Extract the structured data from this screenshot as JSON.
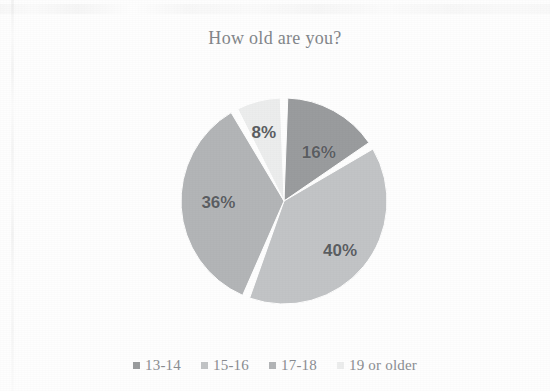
{
  "chart_data": {
    "type": "pie",
    "title": "How old are you?",
    "categories": [
      "13-14",
      "15-16",
      "17-18",
      "19 or older"
    ],
    "values": [
      16,
      40,
      36,
      8
    ],
    "value_labels": [
      "16%",
      "40%",
      "36%",
      "8%"
    ],
    "unit": "%",
    "legend_position": "bottom",
    "grid": false,
    "start_angle_deg": 0,
    "direction": "clockwise",
    "colors": [
      "#9a9c9e",
      "#c2c4c6",
      "#b3b5b7",
      "#eceded"
    ],
    "slices": [
      {
        "label": "13-14",
        "value": 16,
        "value_label": "16%",
        "color": "#9a9c9e"
      },
      {
        "label": "15-16",
        "value": 40,
        "value_label": "40%",
        "color": "#c2c4c6"
      },
      {
        "label": "17-18",
        "value": 36,
        "value_label": "36%",
        "color": "#b3b5b7"
      },
      {
        "label": "19 or older",
        "value": 8,
        "value_label": "8%",
        "color": "#eceded"
      }
    ],
    "xlabel": "",
    "ylabel": ""
  },
  "legend": {
    "items": [
      {
        "label": "13-14",
        "color": "#9a9c9e"
      },
      {
        "label": "15-16",
        "color": "#c2c4c6"
      },
      {
        "label": "17-18",
        "color": "#b3b5b7"
      },
      {
        "label": "19 or older",
        "color": "#eceded"
      }
    ]
  },
  "figure": {
    "background": "#fefefe",
    "title_color": "#83868a",
    "label_color": "#5b5e62"
  }
}
